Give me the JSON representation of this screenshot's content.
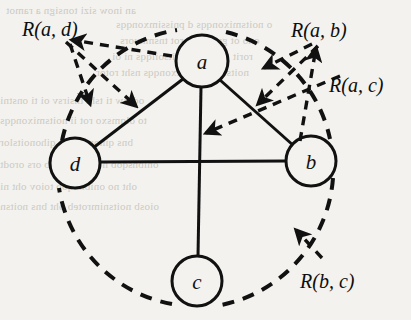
{
  "figure": {
    "type": "graph-diagram",
    "background_color": "#f3f2ee",
    "ink_color": "#111111",
    "nodes": [
      {
        "id": "a",
        "label": "a",
        "cx": 202,
        "cy": 61,
        "r": 26
      },
      {
        "id": "b",
        "label": "b",
        "cx": 311,
        "cy": 161,
        "r": 25
      },
      {
        "id": "c",
        "label": "c",
        "cx": 197,
        "cy": 281,
        "r": 25
      },
      {
        "id": "d",
        "label": "d",
        "cx": 75,
        "cy": 163,
        "r": 25
      }
    ],
    "solid_edges": [
      {
        "from": "a",
        "to": "d"
      },
      {
        "from": "a",
        "to": "b"
      },
      {
        "from": "a",
        "to": "c"
      },
      {
        "from": "d",
        "to": "b"
      }
    ],
    "dashed_circle": {
      "cx": 196,
      "cy": 168,
      "r": 140,
      "style": "dashed"
    },
    "relation_labels": [
      {
        "id": "R_a_d",
        "text": "R(a, d)",
        "x": 22,
        "y": 36,
        "targets": [
          "dashed-arc-a-d",
          "solid-edge-a-d"
        ]
      },
      {
        "id": "R_a_b",
        "text": "R(a, b)",
        "x": 291,
        "y": 37,
        "targets": [
          "dashed-arc-a-b",
          "solid-edge-a-b"
        ]
      },
      {
        "id": "R_a_c",
        "text": "R(a, c)",
        "x": 329,
        "y": 92,
        "targets": [
          "solid-edge-a-c"
        ]
      },
      {
        "id": "R_b_c",
        "text": "R(b, c)",
        "x": 300,
        "y": 288,
        "targets": [
          "dashed-arc-b-c"
        ]
      }
    ],
    "background_ghost_text": [
      {
        "x": 6,
        "y": 4,
        "text": "an inow sizi  tonsign  a  ramot"
      },
      {
        "x": 116,
        "y": 18,
        "text": "o noitsmixonqqs d pnissimxonqqs"
      },
      {
        "x": 120,
        "y": 34,
        "text": "ono  ot  gnois  oi  srot  tnsmnuors"
      },
      {
        "x": 112,
        "y": 50,
        "text": "rorit  ors  snsht  noitsoilqqs  ni  oi"
      },
      {
        "x": 96,
        "y": 66,
        "text": "noitslor  noitsmixonqqs  nsht  rotor"
      },
      {
        "x": 0,
        "y": 94,
        "text": "od  liw  ti  tsht  tnsirsv  oi  ti  onstni"
      },
      {
        "x": 0,
        "y": 114,
        "text": "to  olqmsxo  rot  ii  noitsmixonqqs"
      },
      {
        "x": 0,
        "y": 136,
        "text": "bns  qinonoitslor  qihonoitslor"
      },
      {
        "x": 0,
        "y": 158,
        "text": "onibnsqob  noitsnimroteb  ors  orodt"
      },
      {
        "x": 0,
        "y": 180,
        "text": "oht  no  onibnoqob  toiov  oht  ni"
      },
      {
        "x": 0,
        "y": 200,
        "text": "oiosb  noitsnimroteb  oht  bns  noitsn"
      }
    ]
  }
}
